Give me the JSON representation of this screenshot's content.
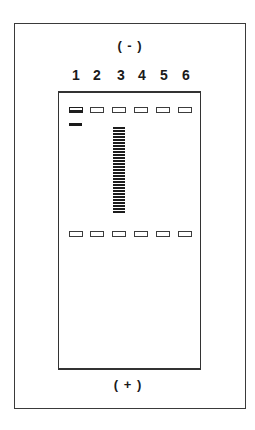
{
  "figure": {
    "type": "gel-electrophoresis-diagram",
    "cathode_label": "( - )",
    "anode_label": "( + )",
    "colors": {
      "line": "#333333",
      "band": "#1a1a1a",
      "background": "#ffffff"
    }
  },
  "lanes": [
    {
      "label": "1",
      "well_loaded": true,
      "bands": [
        "single-band"
      ],
      "ladder": false
    },
    {
      "label": "2",
      "well_loaded": false,
      "bands": [],
      "ladder": false
    },
    {
      "label": "3",
      "well_loaded": false,
      "bands": [],
      "ladder": true
    },
    {
      "label": "4",
      "well_loaded": false,
      "bands": [],
      "ladder": false
    },
    {
      "label": "5",
      "well_loaded": false,
      "bands": [],
      "ladder": false
    },
    {
      "label": "6",
      "well_loaded": false,
      "bands": [],
      "ladder": false
    }
  ],
  "well_rows": [
    {
      "name": "top-wells",
      "count": 6
    },
    {
      "name": "middle-wells",
      "count": 6
    }
  ]
}
